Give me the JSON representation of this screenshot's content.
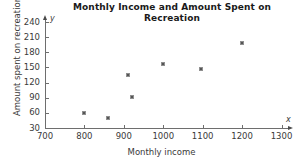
{
  "chart_data": {
    "type": "scatter",
    "title": "Monthly Income and Amount Spent on Recreation",
    "xlabel": "Monthly income",
    "ylabel": "Amount spent on recreation",
    "xlim": [
      700,
      1300
    ],
    "ylim": [
      30,
      240
    ],
    "grid": false,
    "legend": null,
    "x_ticks": [
      700,
      800,
      900,
      1000,
      1100,
      1200,
      1300
    ],
    "y_ticks": [
      30,
      60,
      90,
      120,
      150,
      180,
      210,
      240
    ],
    "axis_letters": {
      "x": "x",
      "y": "y"
    },
    "points": [
      {
        "x": 800,
        "y": 60
      },
      {
        "x": 860,
        "y": 50
      },
      {
        "x": 910,
        "y": 135
      },
      {
        "x": 920,
        "y": 92
      },
      {
        "x": 1000,
        "y": 156
      },
      {
        "x": 1095,
        "y": 146
      },
      {
        "x": 1200,
        "y": 198
      }
    ],
    "series": [
      {
        "name": "Recreation spending",
        "x": [
          800,
          860,
          910,
          920,
          1000,
          1095,
          1200
        ],
        "values": [
          60,
          50,
          135,
          92,
          156,
          146,
          198
        ]
      }
    ]
  },
  "colors": {
    "axis": "#6e6e6e",
    "point": "#555555",
    "text": "#3a3a3a",
    "title": "#1a1a1a",
    "background": "#ffffff"
  }
}
